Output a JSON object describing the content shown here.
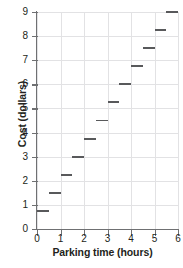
{
  "chart_data": {
    "type": "line",
    "subtype": "step-function",
    "title": "",
    "xlabel": "Parking time (hours)",
    "ylabel": "Cost (dollars)",
    "xlim": [
      0,
      6
    ],
    "ylim": [
      0,
      9
    ],
    "xticks": [
      0,
      1,
      2,
      3,
      4,
      5,
      6
    ],
    "yticks": [
      0,
      1,
      2,
      3,
      4,
      5,
      6,
      7,
      8,
      9
    ],
    "xtick_labels": [
      "0",
      "1",
      "2",
      "3",
      "4",
      "5",
      "6"
    ],
    "ytick_labels": [
      "0",
      "1",
      "2",
      "3",
      "4",
      "5",
      "6",
      "7",
      "8",
      "9"
    ],
    "grid": true,
    "legend": "none",
    "series": [
      {
        "name": "Parking cost",
        "color": "#58595b",
        "segments": [
          {
            "x_start": 0.0,
            "x_end": 0.5,
            "y": 0.75
          },
          {
            "x_start": 0.5,
            "x_end": 1.0,
            "y": 1.5
          },
          {
            "x_start": 1.0,
            "x_end": 1.5,
            "y": 2.25
          },
          {
            "x_start": 1.5,
            "x_end": 2.0,
            "y": 3.0
          },
          {
            "x_start": 2.0,
            "x_end": 2.5,
            "y": 3.75
          },
          {
            "x_start": 2.5,
            "x_end": 3.0,
            "y": 4.5
          },
          {
            "x_start": 3.0,
            "x_end": 3.5,
            "y": 5.25
          },
          {
            "x_start": 3.5,
            "x_end": 4.0,
            "y": 6.0
          },
          {
            "x_start": 4.0,
            "x_end": 4.5,
            "y": 6.75
          },
          {
            "x_start": 4.5,
            "x_end": 5.0,
            "y": 7.5
          },
          {
            "x_start": 5.0,
            "x_end": 5.5,
            "y": 8.25
          },
          {
            "x_start": 5.5,
            "x_end": 6.0,
            "y": 9.0
          }
        ]
      }
    ],
    "colors": {
      "data": "#58595b",
      "axis": "#6f7072",
      "grid": "#e2e2e4",
      "text": "#231f20",
      "background": "#ffffff"
    }
  }
}
